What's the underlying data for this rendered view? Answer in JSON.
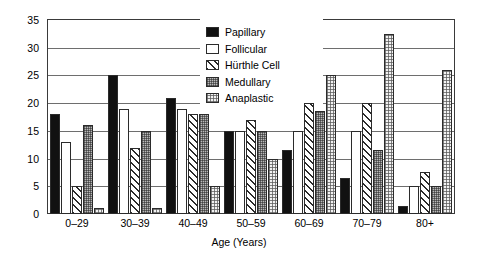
{
  "chart_data": {
    "type": "bar",
    "title": "",
    "xlabel": "Age (Years)",
    "ylabel": "",
    "ylim": [
      0,
      35
    ],
    "ytick_step": 5,
    "yticks": [
      "0",
      "5",
      "10",
      "15",
      "20",
      "25",
      "30",
      "35"
    ],
    "grid": true,
    "legend_position": "top-center-inside",
    "categories": [
      "0–29",
      "30–39",
      "40–49",
      "50–59",
      "60–69",
      "70–79",
      "80+"
    ],
    "series": [
      {
        "name": "Papillary",
        "pattern": "solid-black",
        "color": "#111111",
        "values": [
          18,
          25,
          21,
          15,
          11.5,
          6.5,
          1.5
        ]
      },
      {
        "name": "Follicular",
        "pattern": "white",
        "color": "#ffffff",
        "values": [
          13,
          19,
          19,
          15,
          15,
          15,
          5
        ]
      },
      {
        "name": "Hürthle Cell",
        "pattern": "diagonal-hatch",
        "color": "#ffffff",
        "values": [
          5,
          12,
          18,
          17,
          20,
          20,
          7.5
        ]
      },
      {
        "name": "Medullary",
        "pattern": "dense-grid-gray",
        "color": "#b9b9b9",
        "values": [
          16,
          15,
          18,
          15,
          18.5,
          11.5,
          5
        ]
      },
      {
        "name": "Anaplastic",
        "pattern": "light-dots",
        "color": "#f2f2f2",
        "values": [
          1,
          1,
          5,
          10,
          25,
          32.5,
          26
        ]
      }
    ]
  }
}
